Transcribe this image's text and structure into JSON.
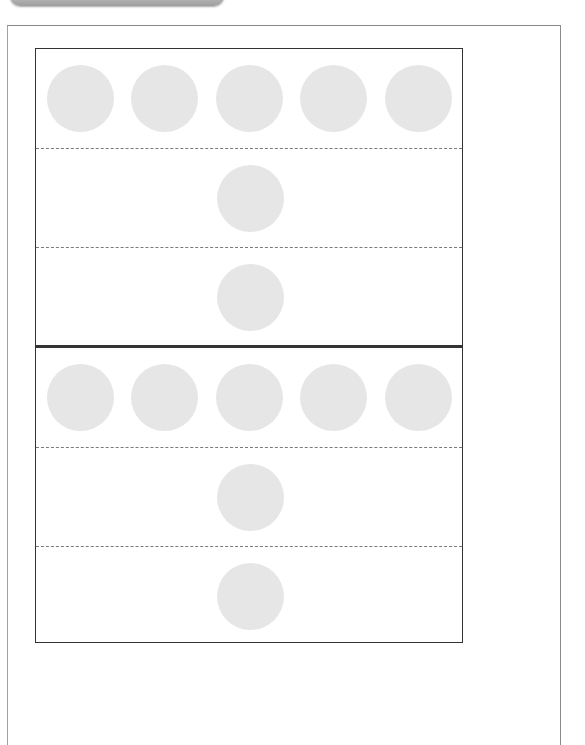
{
  "page": {
    "background": "#ffffff",
    "top_tab": {
      "color": "#b5b5b5"
    },
    "frame_color": "#8a8a8a"
  },
  "cards": [
    {
      "rows": [
        {
          "count": 5
        },
        {
          "count": 1
        },
        {
          "count": 1
        }
      ]
    },
    {
      "rows": [
        {
          "count": 5
        },
        {
          "count": 1
        },
        {
          "count": 1
        }
      ]
    }
  ],
  "style": {
    "circle_color": "#e6e6e6",
    "border_color": "#333333",
    "divider_color": "#7a7a7a",
    "circle_diameter": 67
  }
}
